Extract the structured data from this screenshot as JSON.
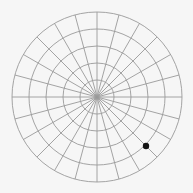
{
  "board": {
    "type": "polar-grid",
    "background": "#f6f6f6",
    "grid_color": "#9a9a9a",
    "center": [
      97,
      97
    ],
    "outer_radius": 85,
    "rings": 5,
    "spokes": 24
  },
  "pieces": [
    {
      "name": "black-stone",
      "x": 146,
      "y": 146,
      "r": 3.2,
      "color": "#111111"
    }
  ]
}
